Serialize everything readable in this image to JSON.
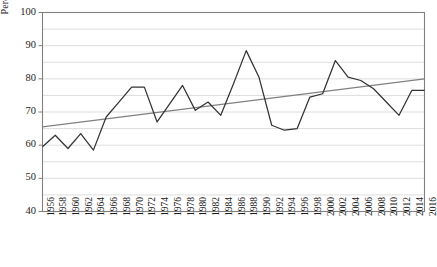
{
  "chart_data": {
    "type": "line",
    "title": "",
    "xlabel": "",
    "ylabel": "Percentage",
    "ylim": [
      40,
      100
    ],
    "ytick_values": [
      40,
      50,
      60,
      70,
      80,
      90,
      100
    ],
    "ytick_labels": [
      "40",
      "50",
      "60",
      "70",
      "80",
      "90",
      "100"
    ],
    "minor_gridline_step": 5,
    "grid": true,
    "legend": "none",
    "categories": [
      "1956",
      "1958",
      "1960",
      "1962",
      "1964",
      "1966",
      "1968",
      "1970",
      "1972",
      "1974",
      "1976",
      "1978",
      "1980",
      "1982",
      "1984",
      "1986",
      "1988",
      "1990",
      "1992",
      "1994",
      "1996",
      "1998",
      "2000",
      "2002",
      "2004",
      "2006",
      "2008",
      "2010",
      "2012",
      "2014",
      "2016"
    ],
    "series": [
      {
        "name": "Percentage",
        "color": "#333333",
        "values": [
          59.5,
          63.0,
          59.0,
          63.5,
          58.5,
          68.5,
          73.0,
          77.5,
          77.5,
          67.0,
          72.5,
          78.0,
          70.5,
          73.0,
          69.0,
          78.5,
          88.5,
          80.5,
          66.0,
          64.5,
          65.0,
          74.5,
          75.5,
          85.5,
          80.5,
          79.5,
          77.0,
          73.0,
          69.0,
          76.5,
          76.5
        ]
      },
      {
        "name": "Linear trend",
        "color": "#808080",
        "type": "trendline",
        "start_value": 65.5,
        "end_value": 80.0
      }
    ]
  },
  "axis": {
    "frame_color": "#808080",
    "gridline_color": "#d9d9d9",
    "tick_color": "#808080"
  }
}
